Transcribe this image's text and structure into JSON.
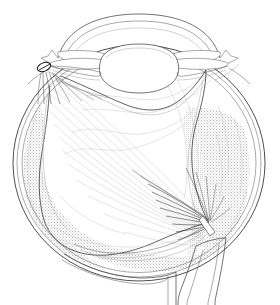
{
  "figure": {
    "kind": "anatomical-line-drawing",
    "caption": "",
    "background_color": "#ffffff",
    "ink_color": "#2b2b2b",
    "stipple_color": "#b8b8b8",
    "width_px": 280,
    "height_px": 305
  },
  "structures": {
    "globe": {
      "label": "globe",
      "center_x": 139,
      "center_y": 163,
      "radius_x": 126,
      "radius_y": 118,
      "wall_layer_count": 3,
      "wall_layers": [
        "sclera",
        "choroid",
        "retinal-pigment-epithelium"
      ]
    },
    "cornea": {
      "label": "cornea",
      "apex_x": 139,
      "apex_y": 16,
      "limbus_left_x": 62,
      "limbus_right_x": 212
    },
    "anterior_chamber": {
      "label": "anterior-chamber"
    },
    "iris_left": {
      "label": "iris-leaflet-left"
    },
    "iris_right": {
      "label": "iris-leaflet-right"
    },
    "lens": {
      "label": "lens",
      "center_x": 139,
      "center_y": 66,
      "half_width": 38,
      "half_height": 22
    },
    "ciliary_body_left": {
      "label": "ciliary-body-left"
    },
    "ciliary_body_right": {
      "label": "ciliary-body-right"
    },
    "retinal_tear": {
      "label": "retinal-tear",
      "x": 44,
      "y": 67,
      "width": 13,
      "height": 8,
      "shade": "#1a1a1a",
      "position_note": "superior-nasal periphery"
    },
    "detached_retina": {
      "label": "detached-retina",
      "form": "funnel",
      "apex_x": 209,
      "apex_y": 222,
      "shade": "#ffffff"
    },
    "subretinal_fluid_left": {
      "label": "subretinal-fluid-left",
      "texture": "stipple",
      "shade": "#b8b8b8"
    },
    "subretinal_fluid_right": {
      "label": "subretinal-fluid-right",
      "texture": "stipple",
      "shade": "#b8b8b8"
    },
    "optic_disc": {
      "label": "optic-disc",
      "x": 209,
      "y": 222,
      "shade": "#ffffff"
    },
    "optic_nerve": {
      "label": "optic-nerve",
      "exit_x": 200,
      "exit_y": 240,
      "direction": "inferior"
    },
    "optic_nerve_sheath": {
      "label": "optic-nerve-sheath"
    },
    "vitreous_striae": {
      "label": "vitreous-striae",
      "count": 14,
      "shade": "#c8c8c8"
    }
  }
}
